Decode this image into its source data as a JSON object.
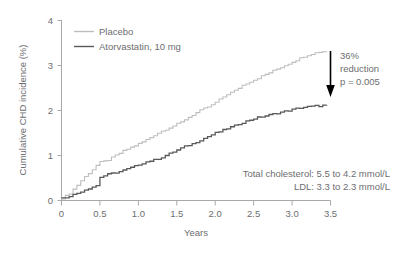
{
  "chart_data": {
    "type": "line",
    "title": "",
    "xlabel": "Years",
    "ylabel": "Cumulative CHD incidence (%)",
    "xlim": [
      0,
      3.5
    ],
    "ylim": [
      0,
      4
    ],
    "grid": false,
    "legend_position": "top-left",
    "xticks": [
      "0",
      "0.5",
      "1.0",
      "1.5",
      "2.0",
      "2.5",
      "3.0",
      "3.5"
    ],
    "xtick_values": [
      0,
      0.5,
      1.0,
      1.5,
      2.0,
      2.5,
      3.0,
      3.5
    ],
    "yticks": [
      "0",
      "1",
      "2",
      "3",
      "4"
    ],
    "ytick_values": [
      0,
      1,
      2,
      3,
      4
    ],
    "series": [
      {
        "name": "Placebo",
        "color": "#bcbec0",
        "x": [
          0,
          0.05,
          0.1,
          0.15,
          0.2,
          0.25,
          0.3,
          0.35,
          0.4,
          0.45,
          0.5,
          0.55,
          0.6,
          0.65,
          0.7,
          0.75,
          0.8,
          0.85,
          0.9,
          0.95,
          1.0,
          1.05,
          1.1,
          1.15,
          1.2,
          1.25,
          1.3,
          1.35,
          1.4,
          1.45,
          1.5,
          1.55,
          1.6,
          1.65,
          1.7,
          1.75,
          1.8,
          1.85,
          1.9,
          1.95,
          2.0,
          2.05,
          2.1,
          2.15,
          2.2,
          2.25,
          2.3,
          2.35,
          2.4,
          2.45,
          2.5,
          2.55,
          2.6,
          2.65,
          2.7,
          2.75,
          2.8,
          2.85,
          2.9,
          2.95,
          3.0,
          3.05,
          3.1,
          3.15,
          3.2,
          3.25,
          3.3,
          3.35,
          3.4,
          3.45
        ],
        "y": [
          0.05,
          0.1,
          0.16,
          0.25,
          0.34,
          0.44,
          0.53,
          0.61,
          0.69,
          0.78,
          0.85,
          0.87,
          0.9,
          0.95,
          1.0,
          1.05,
          1.1,
          1.14,
          1.18,
          1.22,
          1.26,
          1.3,
          1.35,
          1.4,
          1.45,
          1.5,
          1.54,
          1.58,
          1.62,
          1.66,
          1.7,
          1.74,
          1.8,
          1.85,
          1.9,
          1.95,
          2.0,
          2.04,
          2.08,
          2.12,
          2.18,
          2.24,
          2.3,
          2.36,
          2.4,
          2.44,
          2.5,
          2.56,
          2.6,
          2.64,
          2.68,
          2.72,
          2.76,
          2.8,
          2.84,
          2.88,
          2.92,
          2.96,
          3.0,
          3.04,
          3.08,
          3.12,
          3.16,
          3.2,
          3.23,
          3.26,
          3.28,
          3.3,
          3.31,
          3.32
        ]
      },
      {
        "name": "Atorvastatin, 10 mg",
        "color": "#58595b",
        "x": [
          0,
          0.05,
          0.1,
          0.15,
          0.2,
          0.25,
          0.3,
          0.35,
          0.4,
          0.45,
          0.5,
          0.55,
          0.6,
          0.65,
          0.7,
          0.75,
          0.8,
          0.85,
          0.9,
          0.95,
          1.0,
          1.05,
          1.1,
          1.15,
          1.2,
          1.25,
          1.3,
          1.35,
          1.4,
          1.45,
          1.5,
          1.55,
          1.6,
          1.65,
          1.7,
          1.75,
          1.8,
          1.85,
          1.9,
          1.95,
          2.0,
          2.05,
          2.1,
          2.15,
          2.2,
          2.25,
          2.3,
          2.35,
          2.4,
          2.45,
          2.5,
          2.55,
          2.6,
          2.65,
          2.7,
          2.75,
          2.8,
          2.85,
          2.9,
          2.95,
          3.0,
          3.05,
          3.1,
          3.15,
          3.2,
          3.25,
          3.3,
          3.35,
          3.4,
          3.45
        ],
        "y": [
          0.05,
          0.07,
          0.1,
          0.13,
          0.16,
          0.2,
          0.24,
          0.27,
          0.3,
          0.33,
          0.52,
          0.55,
          0.58,
          0.6,
          0.62,
          0.64,
          0.67,
          0.7,
          0.73,
          0.76,
          0.8,
          0.83,
          0.86,
          0.88,
          0.9,
          0.93,
          0.96,
          1.0,
          1.04,
          1.08,
          1.12,
          1.16,
          1.2,
          1.23,
          1.26,
          1.3,
          1.34,
          1.38,
          1.42,
          1.46,
          1.5,
          1.53,
          1.56,
          1.6,
          1.63,
          1.66,
          1.7,
          1.73,
          1.76,
          1.79,
          1.82,
          1.84,
          1.86,
          1.88,
          1.9,
          1.92,
          1.94,
          1.96,
          1.98,
          2.0,
          2.02,
          2.04,
          2.06,
          2.07,
          2.08,
          2.09,
          2.1,
          2.1,
          2.11,
          2.11
        ]
      }
    ],
    "annotations": [
      {
        "id": "reduction",
        "lines": [
          "36%",
          "reduction",
          "p = 0.005"
        ],
        "italic_line_index": 2,
        "arrow": true
      },
      {
        "id": "lipids",
        "lines": [
          "Total cholesterol: 5.5 to 4.2 mmol/L",
          "LDL: 3.3 to 2.3 mmol/L"
        ]
      }
    ]
  },
  "legend": {
    "items": [
      {
        "label": "Placebo",
        "color": "#bcbec0"
      },
      {
        "label": "Atorvastatin, 10 mg",
        "color": "#58595b"
      }
    ]
  },
  "axes": {
    "x_title": "Years",
    "y_title": "Cumulative CHD incidence (%)"
  },
  "annotation_reduction": {
    "line1": "36%",
    "line2": "reduction",
    "line3": "p = 0.005"
  },
  "annotation_lipids": {
    "line1": "Total cholesterol: 5.5 to 4.2 mmol/L",
    "line2": "LDL: 3.3 to 2.3 mmol/L"
  },
  "colors": {
    "placebo": "#bcbec0",
    "atorvastatin": "#58595b",
    "axis": "#a7a9ac",
    "text": "#6d6e71",
    "arrow": "#000000",
    "background": "#ffffff"
  }
}
